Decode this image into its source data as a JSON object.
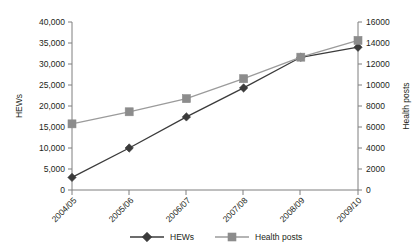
{
  "chart_data": {
    "type": "line",
    "title": "",
    "xlabel": "",
    "ylabel": "HEWs",
    "y2label": "Health posts",
    "categories": [
      "2004/05",
      "2005/06",
      "2006/07",
      "2007/08",
      "2008/09",
      "2009/10"
    ],
    "series": [
      {
        "name": "HEWs",
        "axis": "left",
        "marker": "diamond",
        "color": "#3b3b3b",
        "values": [
          3000,
          10000,
          17400,
          24300,
          31600,
          34000
        ]
      },
      {
        "name": "Health posts",
        "axis": "right",
        "marker": "square",
        "color": "#8c8c8c",
        "values": [
          6300,
          7450,
          8700,
          10600,
          12650,
          14250
        ]
      }
    ],
    "ylim": [
      0,
      40000
    ],
    "y2lim": [
      0,
      16000
    ],
    "yticks": [
      "0",
      "5,000",
      "10,000",
      "15,000",
      "20,000",
      "25,000",
      "30,000",
      "35,000",
      "40,000"
    ],
    "y2ticks": [
      "0",
      "2000",
      "4000",
      "6000",
      "8000",
      "10000",
      "12000",
      "14000",
      "16000"
    ],
    "grid": false,
    "legend_position": "bottom",
    "legend": [
      "HEWs",
      "Health posts"
    ]
  }
}
